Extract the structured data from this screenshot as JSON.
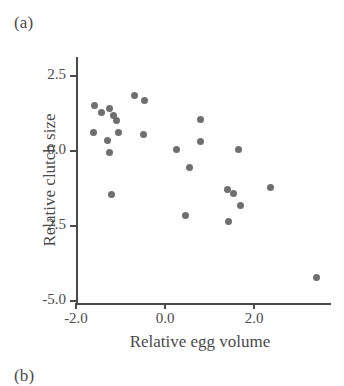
{
  "figure": {
    "panel_label": "(a)",
    "next_panel_label": "(b)",
    "background_color": "#ffffff",
    "axis_color": "#4a4a4a",
    "point_color": "#6f6f6f"
  },
  "chart_data": {
    "type": "scatter",
    "title": "",
    "xlabel": "Relative egg volume",
    "ylabel": "Relative clutch size",
    "xlim": [
      -2.0,
      3.68
    ],
    "ylim": [
      -5.0,
      3.05
    ],
    "xticks": [
      -2.0,
      0.0,
      2.0
    ],
    "xtick_labels": [
      "-2.0",
      "0.0",
      "2.0"
    ],
    "yticks": [
      2.5,
      0.0,
      -2.5,
      -5.0
    ],
    "ytick_labels": [
      "2.5",
      "0.0",
      "-2.5",
      "-5.0"
    ],
    "grid": false,
    "legend": null,
    "marker": "circle",
    "marker_color": "#6f6f6f",
    "points": [
      {
        "x": -1.58,
        "y": 1.53
      },
      {
        "x": -1.42,
        "y": 1.3
      },
      {
        "x": -1.6,
        "y": 0.63
      },
      {
        "x": -1.25,
        "y": 1.42
      },
      {
        "x": -1.16,
        "y": 1.17
      },
      {
        "x": -1.09,
        "y": 1.03
      },
      {
        "x": -1.29,
        "y": 0.35
      },
      {
        "x": -1.04,
        "y": 0.63
      },
      {
        "x": -1.25,
        "y": -0.05
      },
      {
        "x": -0.69,
        "y": 1.85
      },
      {
        "x": -0.45,
        "y": 1.67
      },
      {
        "x": -0.49,
        "y": 0.55
      },
      {
        "x": -1.2,
        "y": -1.45
      },
      {
        "x": 0.25,
        "y": 0.06
      },
      {
        "x": 0.55,
        "y": -0.55
      },
      {
        "x": 0.8,
        "y": 1.05
      },
      {
        "x": 0.8,
        "y": 0.32
      },
      {
        "x": 0.47,
        "y": -2.15
      },
      {
        "x": 1.4,
        "y": -1.28
      },
      {
        "x": 1.53,
        "y": -1.42
      },
      {
        "x": 1.65,
        "y": 0.05
      },
      {
        "x": 1.7,
        "y": -1.82
      },
      {
        "x": 1.42,
        "y": -2.35
      },
      {
        "x": 2.36,
        "y": -1.22
      },
      {
        "x": 3.4,
        "y": -4.22
      }
    ]
  }
}
